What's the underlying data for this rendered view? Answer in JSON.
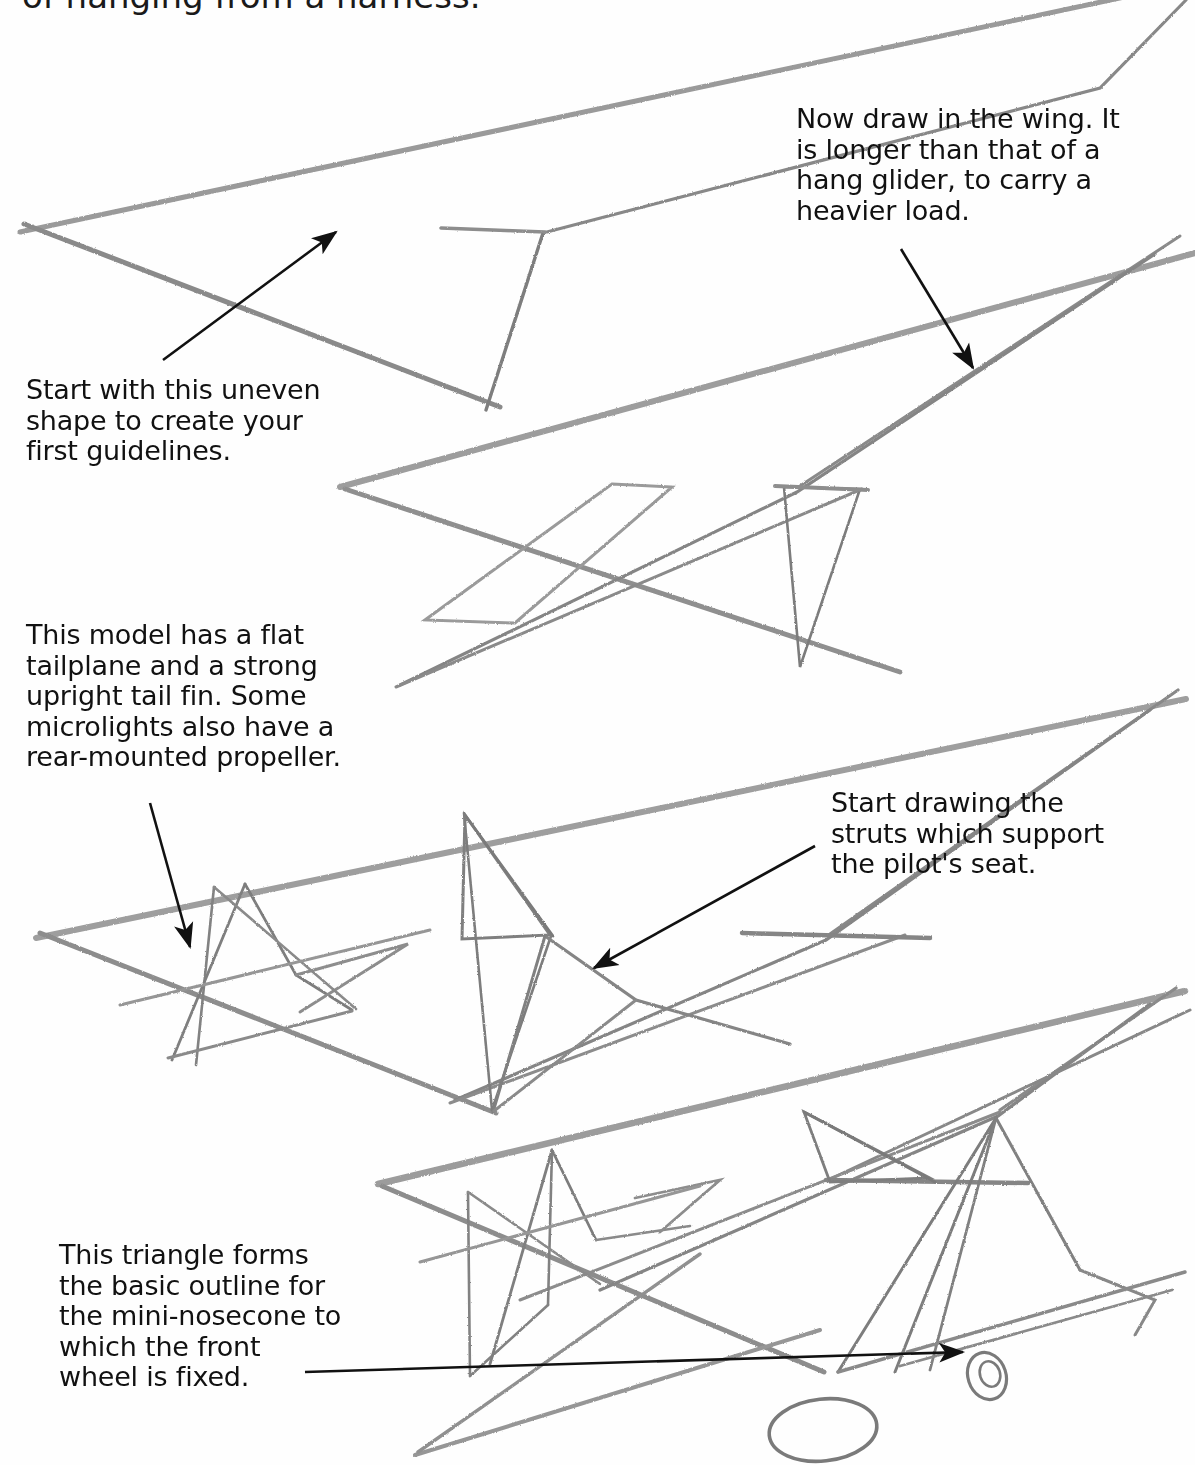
{
  "page": {
    "background_color": "#ffffff",
    "pencil_color": "#8d8d8d",
    "ink_color": "#111111"
  },
  "captions": {
    "cut_off_line": "of hanging from a harness.",
    "start_shape": "Start with this uneven\nshape to create your\nfirst guidelines.",
    "wing": "Now draw in the wing. It\nis longer than that of a\nhang glider, to carry a\nheavier load.",
    "tailplane": "This model has a flat\ntailplane and a strong\nupright tail fin. Some\nmicrolights also have a\nrear-mounted propeller.",
    "struts": "Start drawing the\nstruts which support\nthe pilot's seat.",
    "nosecone": "This triangle forms\nthe basic outline for\nthe mini-nosecone to\nwhich the front\nwheel is fixed."
  },
  "arrows": [
    {
      "name": "arrow-to-first-shape",
      "from": [
        163,
        360
      ],
      "to": [
        336,
        232
      ]
    },
    {
      "name": "arrow-to-wing",
      "from": [
        901,
        249
      ],
      "to": [
        973,
        368
      ]
    },
    {
      "name": "arrow-to-tailplane",
      "from": [
        150,
        803
      ],
      "to": [
        190,
        947
      ]
    },
    {
      "name": "arrow-to-struts",
      "from": [
        815,
        846
      ],
      "to": [
        594,
        968
      ]
    },
    {
      "name": "arrow-to-nosecone",
      "from": [
        305,
        1372
      ],
      "to": [
        963,
        1352
      ]
    }
  ],
  "sketches": [
    {
      "name": "step-1-guidelines",
      "caption_ref": "start_shape"
    },
    {
      "name": "step-2-wing",
      "caption_ref": "wing"
    },
    {
      "name": "step-3-tail-and-struts",
      "caption_ref": "tailplane"
    },
    {
      "name": "step-4-nosecone-and-wheels",
      "caption_ref": "nosecone"
    }
  ]
}
